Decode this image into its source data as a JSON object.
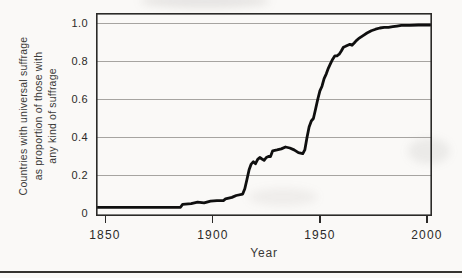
{
  "figure": {
    "y_axis_title_lines": [
      "Countries with universal suffrage",
      "as proportion of those with",
      "any kind of suffrage"
    ],
    "x_axis_title": "Year"
  },
  "chart_data": {
    "type": "line",
    "title": "",
    "xlabel": "Year",
    "ylabel": "Countries with universal suffrage as proportion of those with any kind of suffrage",
    "x_ticks": [
      1850,
      1900,
      1950,
      2000
    ],
    "x_tick_labels": [
      "1850",
      "1900",
      "1950",
      "2000"
    ],
    "y_ticks": [
      0,
      0.2,
      0.4,
      0.6,
      0.8,
      1.0
    ],
    "y_tick_labels": [
      "0",
      "0.2",
      "0.4",
      "0.6",
      "0.8",
      "1.0"
    ],
    "xlim": [
      1845.6,
      2002.3
    ],
    "ylim": [
      -0.013,
      1.055
    ],
    "grid": true,
    "legend": "none",
    "line_color": "#0f0f0f",
    "series": [
      {
        "name": "Countries with universal suffrage as proportion of those with any kind of suffrage",
        "points": [
          [
            1845.6,
            0.033
          ],
          [
            1850,
            0.033
          ],
          [
            1860,
            0.033
          ],
          [
            1870,
            0.033
          ],
          [
            1880,
            0.033
          ],
          [
            1885,
            0.033
          ],
          [
            1886,
            0.048
          ],
          [
            1890,
            0.052
          ],
          [
            1893,
            0.06
          ],
          [
            1896,
            0.056
          ],
          [
            1899,
            0.065
          ],
          [
            1902,
            0.068
          ],
          [
            1905,
            0.068
          ],
          [
            1906,
            0.077
          ],
          [
            1909,
            0.085
          ],
          [
            1911,
            0.095
          ],
          [
            1914,
            0.102
          ],
          [
            1915,
            0.13
          ],
          [
            1916,
            0.18
          ],
          [
            1917,
            0.23
          ],
          [
            1918,
            0.26
          ],
          [
            1919,
            0.272
          ],
          [
            1920,
            0.262
          ],
          [
            1921,
            0.285
          ],
          [
            1922,
            0.295
          ],
          [
            1923,
            0.287
          ],
          [
            1924,
            0.28
          ],
          [
            1925,
            0.295
          ],
          [
            1926,
            0.3
          ],
          [
            1927,
            0.3
          ],
          [
            1928,
            0.33
          ],
          [
            1930,
            0.335
          ],
          [
            1932,
            0.34
          ],
          [
            1934,
            0.35
          ],
          [
            1936,
            0.345
          ],
          [
            1938,
            0.335
          ],
          [
            1940,
            0.32
          ],
          [
            1942,
            0.315
          ],
          [
            1943,
            0.335
          ],
          [
            1944,
            0.4
          ],
          [
            1945,
            0.455
          ],
          [
            1946,
            0.487
          ],
          [
            1947,
            0.5
          ],
          [
            1948,
            0.55
          ],
          [
            1949,
            0.6
          ],
          [
            1950,
            0.645
          ],
          [
            1951,
            0.67
          ],
          [
            1952,
            0.71
          ],
          [
            1953,
            0.735
          ],
          [
            1954,
            0.765
          ],
          [
            1955,
            0.79
          ],
          [
            1956,
            0.812
          ],
          [
            1957,
            0.83
          ],
          [
            1958,
            0.83
          ],
          [
            1959,
            0.838
          ],
          [
            1960,
            0.855
          ],
          [
            1961,
            0.875
          ],
          [
            1962,
            0.88
          ],
          [
            1963,
            0.885
          ],
          [
            1964,
            0.89
          ],
          [
            1965,
            0.885
          ],
          [
            1966,
            0.897
          ],
          [
            1967,
            0.91
          ],
          [
            1968,
            0.92
          ],
          [
            1970,
            0.935
          ],
          [
            1972,
            0.95
          ],
          [
            1974,
            0.962
          ],
          [
            1976,
            0.97
          ],
          [
            1978,
            0.976
          ],
          [
            1980,
            0.98
          ],
          [
            1982,
            0.98
          ],
          [
            1984,
            0.983
          ],
          [
            1986,
            0.986
          ],
          [
            1988,
            0.99
          ],
          [
            1992,
            0.99
          ],
          [
            1996,
            0.992
          ],
          [
            2000,
            0.992
          ],
          [
            2001.5,
            0.992
          ]
        ]
      }
    ]
  },
  "colors": {
    "background": "#faf9f7",
    "grid": "#a6a4a1",
    "axis": "#2b2a28",
    "text": "#2b2a28",
    "line": "#0f0f0f",
    "rule": "#35332f"
  }
}
